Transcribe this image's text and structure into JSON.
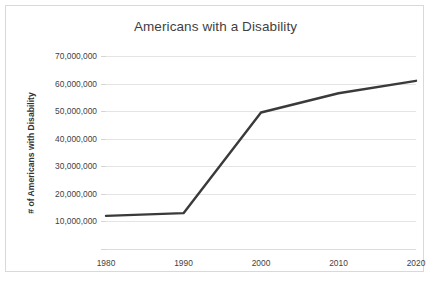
{
  "chart_data": {
    "type": "line",
    "title": "Americans with a Disability",
    "xlabel": "",
    "ylabel": "# of Americans with Disability",
    "x": [
      1980,
      1990,
      2000,
      2010,
      2020
    ],
    "categories": [
      "1980",
      "1990",
      "2000",
      "2010",
      "2020"
    ],
    "values": [
      12000000,
      13000000,
      49500000,
      56500000,
      61000000
    ],
    "series": [
      {
        "name": "# of Americans with Disability",
        "values": [
          12000000,
          13000000,
          49500000,
          56500000,
          61000000
        ]
      }
    ],
    "xlim": [
      1980,
      2020
    ],
    "ylim": [
      0,
      70000000
    ],
    "ytick_values": [
      0,
      10000000,
      20000000,
      30000000,
      40000000,
      50000000,
      60000000,
      70000000
    ],
    "ytick_labels": [
      "",
      "10,000,000",
      "20,000,000",
      "30,000,000",
      "40,000,000",
      "50,000,000",
      "60,000,000",
      "70,000,000"
    ],
    "xtick_labels": [
      "1980",
      "1990",
      "2000",
      "2010",
      "2020"
    ],
    "grid": true,
    "legend": false,
    "legend_position": "none",
    "line_color": "#3a3a3a",
    "grid_color": "#e4e4e4",
    "text_color": "#3f3f3f",
    "border_color": "#d9d9d9",
    "background_color": "#ffffff"
  }
}
